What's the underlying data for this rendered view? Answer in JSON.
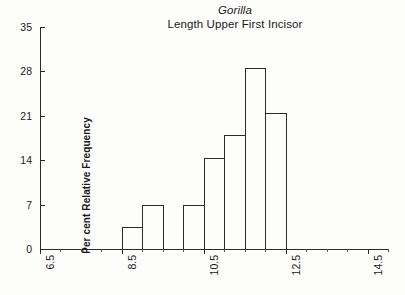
{
  "chart_data": {
    "type": "bar",
    "title": "Gorilla\nLength Upper First Incisor",
    "title_line1": "Gorilla",
    "title_line2": "Length Upper First Incisor",
    "xlabel": "",
    "ylabel": "Per cent Relative Frequency",
    "ylim": [
      0,
      35
    ],
    "yticks": [
      0,
      7,
      14,
      21,
      28,
      35
    ],
    "ytick_labels": [
      "0",
      "7",
      "14",
      "21",
      "28",
      "35"
    ],
    "xlim": [
      6.5,
      15.0
    ],
    "xticks": [
      6.5,
      8.5,
      10.5,
      12.5,
      14.5
    ],
    "xtick_labels": [
      "6.5",
      "8.5",
      "10.5",
      "12.5",
      "14.5"
    ],
    "grid": false,
    "legend": null,
    "bin_width": 0.5,
    "bin_edges": [
      8.0,
      8.5,
      9.0,
      9.5,
      10.0,
      10.5,
      11.0,
      11.5,
      12.0,
      12.5,
      13.0,
      13.5
    ],
    "categories": [
      "8.0-8.5",
      "8.5-9.0",
      "9.0-9.5",
      "9.5-10.0",
      "10.0-10.5",
      "10.5-11.0",
      "11.0-11.5",
      "11.5-12.0",
      "12.0-12.5",
      "12.5-13.0",
      "13.0-13.5"
    ],
    "values": [
      0,
      3.5,
      7.0,
      0,
      0,
      7.0,
      14.3,
      18.0,
      28.5,
      21.5,
      0
    ],
    "bars": [
      {
        "label": "8.5-9.0",
        "x_start": 8.5,
        "x_end": 9.0,
        "value": 3.5
      },
      {
        "label": "9.0-9.5",
        "x_start": 9.0,
        "x_end": 9.5,
        "value": 7.0
      },
      {
        "label": "10.0-10.5",
        "x_start": 10.0,
        "x_end": 10.5,
        "value": 7.0
      },
      {
        "label": "10.5-11.0",
        "x_start": 10.5,
        "x_end": 11.0,
        "value": 14.3
      },
      {
        "label": "11.0-11.5",
        "x_start": 11.0,
        "x_end": 11.5,
        "value": 18.0
      },
      {
        "label": "11.5-12.0",
        "x_start": 11.5,
        "x_end": 12.0,
        "value": 28.5
      },
      {
        "label": "12.0-12.5",
        "x_start": 12.0,
        "x_end": 12.5,
        "value": 21.5
      }
    ],
    "colors": {
      "bar_edge": "#2b2b2b",
      "bar_fill": "transparent",
      "axis": "#2b2b2b",
      "text": "#1a1a1a",
      "background": "#fdfdfb"
    }
  }
}
